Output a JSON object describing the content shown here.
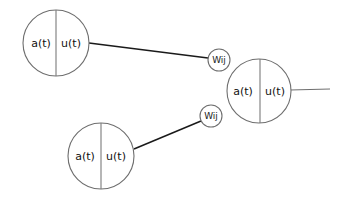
{
  "diagram": {
    "type": "neural-network-connection",
    "nodes": [
      {
        "id": "neuron-i1",
        "left_label": "a(t)",
        "right_label": "u(t)"
      },
      {
        "id": "neuron-i2",
        "left_label": "a(t)",
        "right_label": "u(t)"
      },
      {
        "id": "neuron-j",
        "left_label": "a(t)",
        "right_label": "u(t)"
      }
    ],
    "weights": [
      {
        "id": "weight-upper",
        "label": "Wij"
      },
      {
        "id": "weight-lower",
        "label": "Wij"
      }
    ],
    "colors": {
      "stroke": "#6e6e6e",
      "edge": "#1a1a1a",
      "text": "#111111"
    }
  }
}
